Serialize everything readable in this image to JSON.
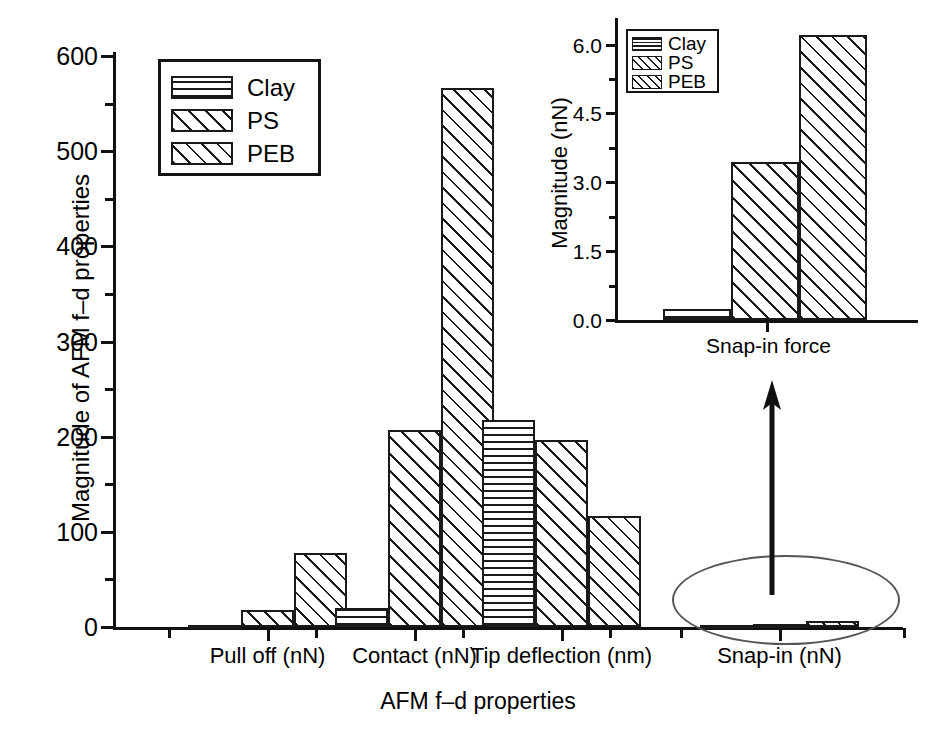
{
  "chart_data": [
    {
      "id": "main",
      "type": "bar",
      "title": "",
      "xlabel": "AFM f–d properties",
      "ylabel": "Magnitude of AFM f–d properties",
      "categories": [
        "Pull off (nN)",
        "Contact (nN)",
        "Tip deflection (nm)",
        "Snap-in (nN)"
      ],
      "series": [
        {
          "name": "Clay",
          "pattern": "horizontal-lines",
          "values": [
            0,
            20,
            218,
            0.25
          ]
        },
        {
          "name": "PS",
          "pattern": "diagonal-hatch",
          "values": [
            18,
            207,
            196,
            3.45
          ]
        },
        {
          "name": "PEB",
          "pattern": "cross-hatch",
          "values": [
            78,
            566,
            117,
            6.2
          ]
        }
      ],
      "ylim": [
        0,
        600
      ],
      "yticks": [
        0,
        100,
        200,
        300,
        400,
        500,
        600
      ],
      "ytick_labels": [
        "0",
        "100",
        "200",
        "300",
        "400",
        "500",
        "600"
      ],
      "yminor_interval": 50,
      "grid": false,
      "legend_position": "upper-left",
      "legend_entries": [
        "Clay",
        "PS",
        "PEB"
      ]
    },
    {
      "id": "inset",
      "type": "bar",
      "title": "",
      "xlabel": "Snap-in force",
      "ylabel": "Magnitude (nN)",
      "categories": [
        "Snap-in force"
      ],
      "series": [
        {
          "name": "Clay",
          "pattern": "horizontal-lines",
          "values": [
            0.25
          ]
        },
        {
          "name": "PS",
          "pattern": "diagonal-hatch",
          "values": [
            3.45
          ]
        },
        {
          "name": "PEB",
          "pattern": "cross-hatch",
          "values": [
            6.2
          ]
        }
      ],
      "ylim": [
        0,
        6.6
      ],
      "yticks": [
        0.0,
        1.5,
        3.0,
        4.5,
        6.0
      ],
      "ytick_labels": [
        "0.0",
        "1.5",
        "3.0",
        "4.5",
        "6.0"
      ],
      "yminor_interval": 0.75,
      "grid": false,
      "legend_position": "upper-left",
      "legend_entries": [
        "Clay",
        "PS",
        "PEB"
      ]
    }
  ],
  "main": {
    "ylabel": "Magnitude of AFM f–d properties",
    "xlabel": "AFM f–d properties",
    "ytick_labels": [
      "0",
      "100",
      "200",
      "300",
      "400",
      "500",
      "600"
    ],
    "categories": [
      "Pull off (nN)",
      "Contact (nN)",
      "Tip deflection (nm)",
      "Snap-in (nN)"
    ],
    "legend": {
      "clay": "Clay",
      "ps": "PS",
      "peb": "PEB"
    }
  },
  "inset": {
    "ylabel": "Magnitude (nN)",
    "xlabel": "Snap-in force",
    "ytick_labels": [
      "0.0",
      "1.5",
      "3.0",
      "4.5",
      "6.0"
    ],
    "legend": {
      "clay": "Clay",
      "ps": "PS",
      "peb": "PEB"
    }
  },
  "annotation": {
    "callout": "ellipse-highlight-with-arrow-to-inset"
  },
  "colors": {
    "ink": "#1a1a1a",
    "background": "#ffffff",
    "callout_outline": "#555555"
  }
}
